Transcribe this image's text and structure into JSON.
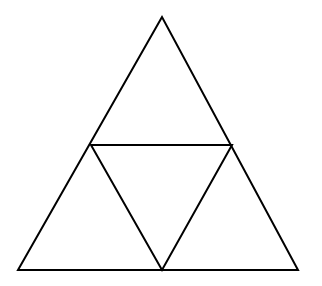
{
  "diagram": {
    "type": "subdivided-triangle",
    "stroke_color": "#000000",
    "background": "#ffffff",
    "stroke_width": 2,
    "outer_triangle": {
      "apex": [
        162,
        17
      ],
      "left": [
        18,
        270
      ],
      "right": [
        298,
        270
      ]
    },
    "inner_triangle": {
      "left": [
        91,
        145
      ],
      "right": [
        232,
        145
      ],
      "bottom": [
        162,
        270
      ]
    },
    "sub_triangle_count": 4
  }
}
